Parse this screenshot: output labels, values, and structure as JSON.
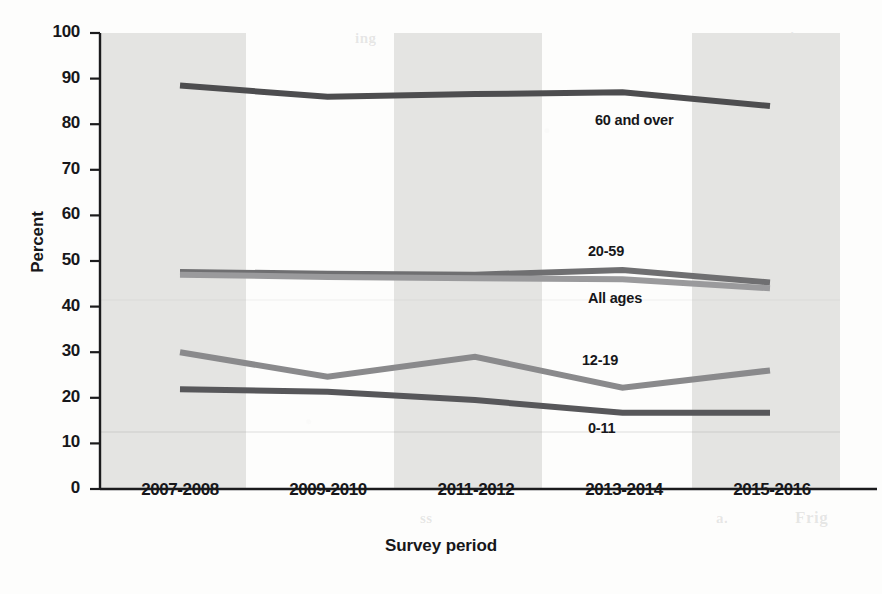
{
  "chart_data": {
    "type": "line",
    "title": "",
    "xlabel": "Survey period",
    "ylabel": "Percent",
    "categories": [
      "2007-2008",
      "2009-2010",
      "2011-2012",
      "2013-2014",
      "2015-2016"
    ],
    "ylim": [
      0,
      100
    ],
    "yticks": [
      0,
      10,
      20,
      30,
      40,
      50,
      60,
      70,
      80,
      90,
      100
    ],
    "grid": false,
    "legend_position": "inline-labels",
    "series": [
      {
        "name": "60 and over",
        "values": [
          88.5,
          86.0,
          86.6,
          87.0,
          84.0
        ],
        "color": "#4d4d4f",
        "label_x": 595,
        "label_y": 118
      },
      {
        "name": "20-59",
        "values": [
          47.6,
          47.2,
          47.0,
          48.0,
          45.3
        ],
        "color": "#6f6f71",
        "label_x": 588,
        "label_y": 248
      },
      {
        "name": "All ages",
        "values": [
          47.0,
          46.5,
          46.2,
          46.0,
          44.0
        ],
        "color": "#9a9a9c",
        "label_x": 588,
        "label_y": 294
      },
      {
        "name": "12-19",
        "values": [
          30.0,
          24.6,
          29.0,
          22.2,
          26.0
        ],
        "color": "#8a8a8c",
        "label_x": 582,
        "label_y": 355
      },
      {
        "name": "0-11",
        "values": [
          21.9,
          21.3,
          19.5,
          16.7,
          16.7
        ],
        "color": "#57575a",
        "label_x": 588,
        "label_y": 423
      }
    ]
  },
  "axes": {
    "y_title": "Percent",
    "x_title": "Survey period",
    "y_tick_labels": [
      "100",
      "90",
      "80",
      "70",
      "60",
      "50",
      "40",
      "30",
      "20",
      "10",
      "0"
    ],
    "x_tick_labels": [
      "2007-2008",
      "2009-2010",
      "2011-2012",
      "2013-2014",
      "2015-2016"
    ]
  },
  "series_labels": {
    "s0": "60 and over",
    "s1": "20-59",
    "s2": "All ages",
    "s3": "12-19",
    "s4": "0-11"
  },
  "colors": {
    "band": "#e4e4e2",
    "plot_bg": "#ffffff",
    "axis": "#1b1b1d",
    "text": "#17171a"
  },
  "ghost_text": {
    "g1": "ing",
    "g2": "nd",
    "g3": "on",
    "g4": "us",
    "g5": "in",
    "g6": "3.9",
    "g7": "2.1",
    "g8": "ss",
    "g9": "a.",
    "g10": "Frig"
  }
}
